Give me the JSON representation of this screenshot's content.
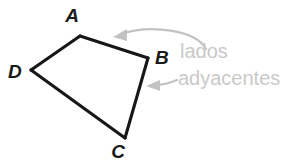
{
  "figure": {
    "background_color": "#ffffff",
    "line_color": "#171717",
    "annotation_color": "#c9c9c9",
    "arrow_color": "#c2c2c2",
    "shape": {
      "type": "quadrilateral",
      "name": "ABCD",
      "vertices": [
        {
          "id": "A",
          "label": "A",
          "x": 80,
          "y": 36,
          "label_x": 72,
          "label_y": 22
        },
        {
          "id": "B",
          "label": "B",
          "x": 148,
          "y": 58,
          "label_x": 155,
          "label_y": 64
        },
        {
          "id": "C",
          "label": "C",
          "x": 125,
          "y": 138,
          "label_x": 118,
          "label_y": 158
        },
        {
          "id": "D",
          "label": "D",
          "x": 31,
          "y": 70,
          "label_x": 8,
          "label_y": 78
        }
      ],
      "edges": [
        {
          "id": "AB",
          "from": "A",
          "to": "B",
          "highlighted": true
        },
        {
          "id": "BC",
          "from": "B",
          "to": "C",
          "highlighted": true
        },
        {
          "id": "CD",
          "from": "C",
          "to": "D",
          "highlighted": false
        },
        {
          "id": "DA",
          "from": "D",
          "to": "A",
          "highlighted": false
        }
      ]
    },
    "annotations": [
      {
        "id": "lados",
        "text": "lados",
        "x": 180,
        "y": 58,
        "points_to_edge": "AB"
      },
      {
        "id": "adyacentes",
        "text": "adyacentes",
        "x": 178,
        "y": 85,
        "points_to_edge": "BC"
      }
    ],
    "arrows": [
      {
        "id": "arrow-to-ab",
        "kind": "curved",
        "path": "M 206 49 C 196 30, 150 24, 118 35",
        "head": "118,35 129,30 128,41",
        "target_edge": "AB"
      },
      {
        "id": "arrow-to-bc",
        "kind": "straight",
        "path": "M 176 80 C 168 83, 160 85, 150 85",
        "head": "146,85 159,80 158,90",
        "target_edge": "BC"
      }
    ]
  }
}
